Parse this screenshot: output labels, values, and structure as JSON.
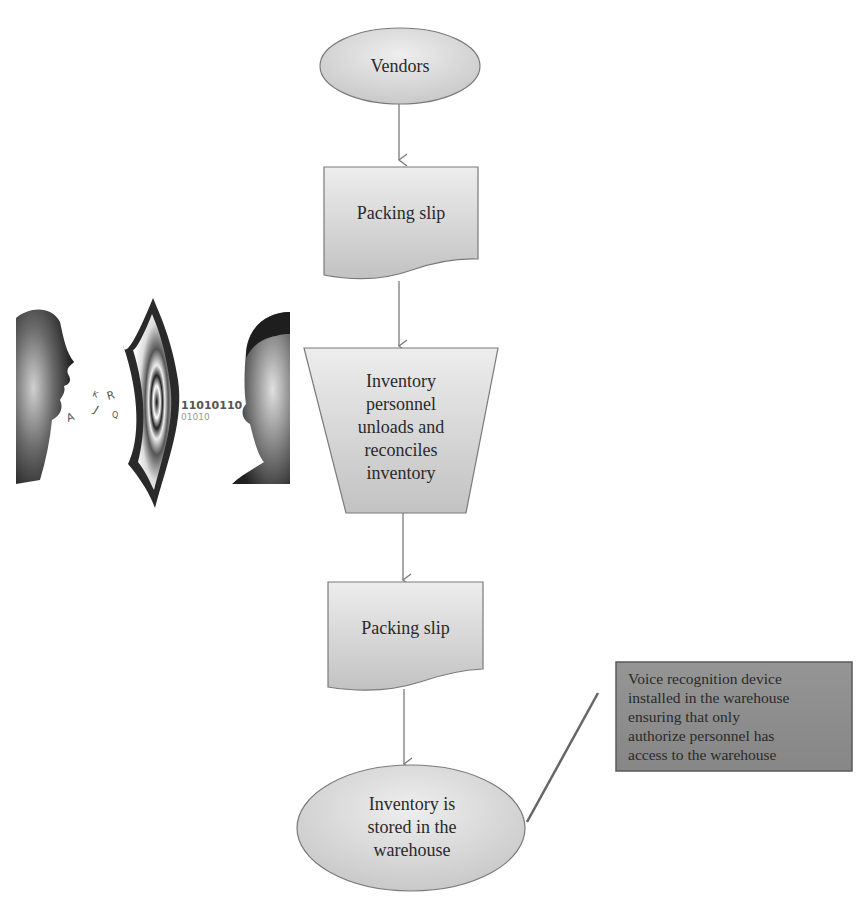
{
  "diagram": {
    "type": "flowchart",
    "nodes": [
      {
        "id": "vendors",
        "shape": "terminator-ellipse",
        "label": "Vendors"
      },
      {
        "id": "packing-slip-1",
        "shape": "document",
        "label": "Packing slip"
      },
      {
        "id": "unload-reconcile",
        "shape": "manual-operation",
        "label": "Inventory\npersonnel\nunloads and\nreconciles\ninventory"
      },
      {
        "id": "packing-slip-2",
        "shape": "document",
        "label": "Packing slip"
      },
      {
        "id": "stored",
        "shape": "terminator-ellipse",
        "label": "Inventory is\nstored in the\nwarehouse"
      }
    ],
    "edges": [
      {
        "from": "vendors",
        "to": "packing-slip-1"
      },
      {
        "from": "packing-slip-1",
        "to": "unload-reconcile"
      },
      {
        "from": "unload-reconcile",
        "to": "packing-slip-2"
      },
      {
        "from": "packing-slip-2",
        "to": "stored"
      }
    ],
    "annotation": {
      "attached_to": "stored",
      "text": "Voice recognition device\ninstalled in the warehouse\nensuring that only\nauthorize personnel has\naccess to the warehouse"
    },
    "illustration": {
      "description": "voice-recognition-illustration",
      "binary_text": "11010110",
      "binary_text_2": "01010",
      "letters": [
        "A",
        "J",
        "R",
        "K",
        "Q"
      ]
    },
    "colors": {
      "shape_fill_light": "#e6e6e6",
      "shape_fill_dark": "#c4c4c4",
      "shape_stroke": "#7a7a7a",
      "arrow": "#7a7a7a",
      "note_fill": "#8e8e8e",
      "note_stroke": "#5a5a5a",
      "connector": "#666666",
      "text": "#2a2a2a"
    }
  }
}
